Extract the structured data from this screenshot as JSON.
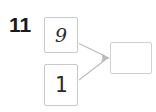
{
  "worksheet": {
    "question_number": "11",
    "background_color": "#ffffff",
    "box_border_color": "#c8c9cb",
    "arrow_color": "#b9babc",
    "ink_color": "#2a2a2a"
  },
  "diagram": {
    "type": "part-part-whole-addition-bond",
    "addend_1": {
      "label": "9",
      "filled": true
    },
    "addend_2": {
      "label": "1",
      "filled": true
    },
    "sum": {
      "label": "",
      "filled": false
    },
    "arrows": [
      {
        "name": "arrow-addend-1-to-sum",
        "from": "addend_1",
        "to": "sum"
      },
      {
        "name": "arrow-addend-2-to-sum",
        "from": "addend_2",
        "to": "sum"
      }
    ]
  }
}
